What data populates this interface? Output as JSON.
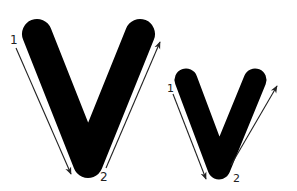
{
  "diagram": {
    "letters": [
      {
        "name": "uppercase",
        "letter": "V",
        "strokes": [
          {
            "number": "1",
            "direction": "down-right"
          },
          {
            "number": "2",
            "direction": "up-right"
          }
        ]
      },
      {
        "name": "lowercase",
        "letter": "v",
        "strokes": [
          {
            "number": "1",
            "direction": "down-right"
          },
          {
            "number": "2",
            "direction": "up-right"
          }
        ]
      }
    ],
    "colors": {
      "glyph": "#000000",
      "arrow": "#222222",
      "background": "#ffffff"
    }
  }
}
